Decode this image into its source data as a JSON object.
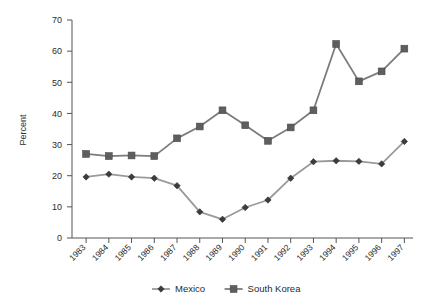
{
  "chart_data": {
    "type": "line",
    "title": "",
    "xlabel": "",
    "ylabel": "Percent",
    "ylim": [
      0,
      70
    ],
    "ytick_step": 10,
    "yticks": [
      "0",
      "10",
      "20",
      "30",
      "40",
      "50",
      "60",
      "70"
    ],
    "grid": false,
    "legend_position": "bottom-center",
    "categories": [
      "1983",
      "1984",
      "1985",
      "1986",
      "1987",
      "1988",
      "1989",
      "1990",
      "1991",
      "1992",
      "1993",
      "1994",
      "1995",
      "1996",
      "1997"
    ],
    "series": [
      {
        "name": "Mexico",
        "marker": "diamond",
        "color": "#8c8c8c",
        "values": [
          19.6,
          20.5,
          19.6,
          19.2,
          16.8,
          8.4,
          6.0,
          9.8,
          12.2,
          19.2,
          24.5,
          24.8,
          24.6,
          23.8,
          31.0
        ]
      },
      {
        "name": "South Korea",
        "marker": "square",
        "color": "#6e6e6e",
        "values": [
          27.0,
          26.3,
          26.5,
          26.3,
          32.0,
          35.8,
          41.0,
          36.2,
          31.2,
          35.5,
          41.0,
          62.3,
          50.3,
          53.5,
          60.8
        ]
      }
    ]
  },
  "legend": {
    "entries": [
      {
        "label": "Mexico",
        "marker": "diamond"
      },
      {
        "label": "South Korea",
        "marker": "square"
      }
    ]
  },
  "axis": {
    "y_title": "Percent"
  },
  "colors": {
    "mexico_line": "#8c8c8c",
    "mexico_marker": "#3a3a3a",
    "korea_line": "#7a7a7a",
    "korea_marker": "#5a5a5a",
    "axis": "#555555",
    "text": "#2b2b2b",
    "background": "#ffffff"
  }
}
